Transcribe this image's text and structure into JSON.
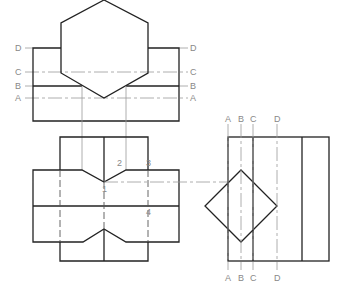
{
  "top_view": {
    "labels_left": {
      "D": "D",
      "C": "C",
      "B": "B",
      "A": "A"
    },
    "labels_right": {
      "D": "D",
      "C": "C",
      "B": "B",
      "A": "A"
    }
  },
  "front_view": {
    "point_labels": {
      "p1": "1",
      "p2": "2",
      "p3": "3",
      "p4": "4"
    }
  },
  "side_view": {
    "labels_top": {
      "A": "A",
      "B": "B",
      "C": "C",
      "D": "D"
    },
    "labels_bottom": {
      "A": "A",
      "B": "B",
      "C": "C",
      "D": "D"
    }
  }
}
